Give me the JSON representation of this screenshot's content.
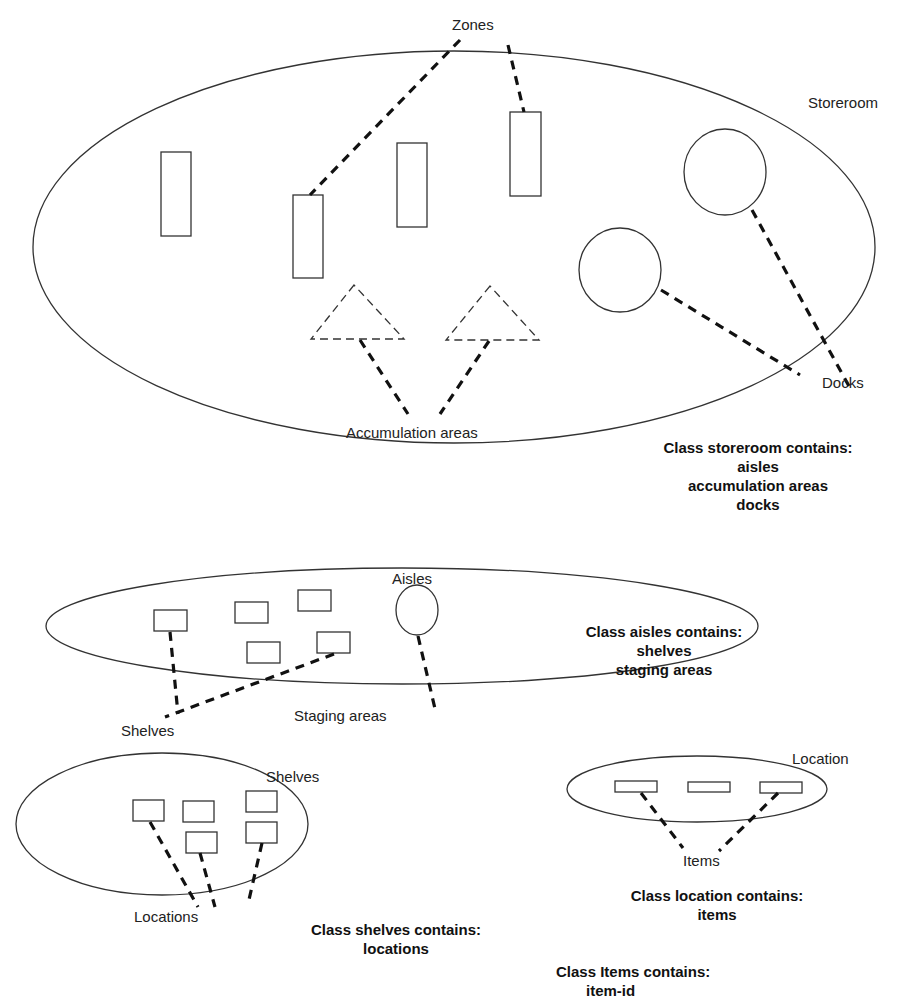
{
  "labels": {
    "zones": "Zones",
    "storeroom": "Storeroom",
    "docks": "Docks",
    "accumulation_areas": "Accumulation areas",
    "aisles": "Aisles",
    "shelves_pointer": "Shelves",
    "staging_areas": "Staging areas",
    "shelves_container": "Shelves",
    "locations": "Locations",
    "location_container": "Location",
    "items": "Items"
  },
  "classes": {
    "storeroom": {
      "title": "Class storeroom contains:",
      "members": [
        "aisles",
        "accumulation areas",
        "docks"
      ]
    },
    "aisles": {
      "title": "Class aisles contains:",
      "members": [
        "shelves",
        "staging areas"
      ]
    },
    "shelves": {
      "title": "Class shelves contains:",
      "members": [
        "locations"
      ]
    },
    "location": {
      "title": "Class location contains:",
      "members": [
        "items"
      ]
    },
    "items": {
      "title": "Class Items contains:",
      "members": [
        "item-id"
      ]
    }
  },
  "colors": {
    "stroke": "#333333",
    "text": "#222222",
    "background": "#ffffff"
  }
}
